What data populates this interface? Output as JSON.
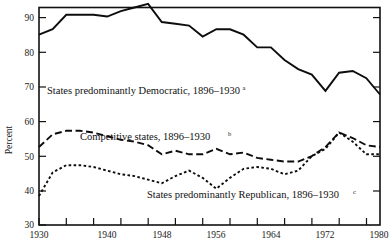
{
  "chart_data": {
    "type": "line",
    "title": "",
    "xlabel": "",
    "ylabel": "Percent",
    "xlim": [
      1930,
      1980
    ],
    "ylim": [
      30,
      90
    ],
    "grid": false,
    "legend_position": "inline-annotations",
    "x": [
      1930,
      1932,
      1934,
      1936,
      1938,
      1940,
      1942,
      1944,
      1946,
      1948,
      1950,
      1952,
      1954,
      1956,
      1958,
      1960,
      1962,
      1964,
      1966,
      1968,
      1970,
      1972,
      1974,
      1976,
      1978,
      1980
    ],
    "xtick_values": [
      1930,
      1934,
      1938,
      1942,
      1946,
      1950,
      1954,
      1958,
      1962,
      1966,
      1970,
      1974,
      1978
    ],
    "xtick_labels_shown": [
      "1930",
      "1940",
      "1948",
      "1956",
      "1964",
      "1972",
      "1980"
    ],
    "xtick_labels_values": [
      1930,
      1940,
      1948,
      1956,
      1964,
      1972,
      1980
    ],
    "ytick_values": [
      30,
      40,
      50,
      60,
      70,
      80,
      90
    ],
    "ytick_labels": [
      "30",
      "40",
      "50",
      "60",
      "70",
      "80",
      "90"
    ],
    "series": [
      {
        "name": "States predominantly Democratic, 1896–1930",
        "footnote": "a",
        "style": "solid",
        "values": [
          82.5,
          84.0,
          88.0,
          88.0,
          88.0,
          87.5,
          89.0,
          90.0,
          91.0,
          86.0,
          85.5,
          85.0,
          82.0,
          84.0,
          84.0,
          82.5,
          79.0,
          79.0,
          75.5,
          73.0,
          71.5,
          67.0,
          72.0,
          72.5,
          70.5,
          66.0
        ]
      },
      {
        "name": "Competitive states, 1896–1930",
        "footnote": "b",
        "style": "dashed",
        "values": [
          51.5,
          55.0,
          56.0,
          56.0,
          55.5,
          54.5,
          53.5,
          53.0,
          52.0,
          49.5,
          50.5,
          49.5,
          49.5,
          51.0,
          49.5,
          50.0,
          48.5,
          48.0,
          47.5,
          47.5,
          49.0,
          51.5,
          55.5,
          54.0,
          52.0,
          51.5
        ]
      },
      {
        "name": "States predominantly Republican, 1896–1930",
        "footnote": "c",
        "style": "dotted",
        "values": [
          38.0,
          44.5,
          46.5,
          46.5,
          46.0,
          45.0,
          44.0,
          43.5,
          42.5,
          41.5,
          43.5,
          45.0,
          43.0,
          40.0,
          43.0,
          45.5,
          46.0,
          45.5,
          44.0,
          45.0,
          49.0,
          51.0,
          55.5,
          53.0,
          49.5,
          49.5
        ]
      }
    ],
    "annotations": [
      {
        "text": "States predominantly Democratic, 1896–1930",
        "footnote": "a"
      },
      {
        "text": "Competitive states, 1896–1930",
        "footnote": "b"
      },
      {
        "text": "States predominantly Republican, 1896–1930",
        "footnote": "c"
      }
    ],
    "colors": {
      "line": "#0d0d0d",
      "axis": "#111111",
      "background": "#ffffff"
    }
  }
}
